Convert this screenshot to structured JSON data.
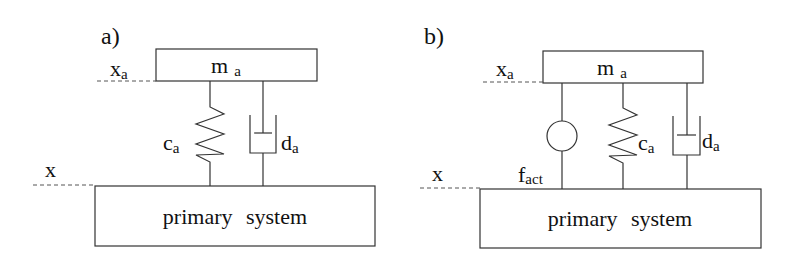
{
  "panels": [
    {
      "id": "a",
      "label": "a)",
      "mass": {
        "symbol": "m",
        "subscript": "a"
      },
      "absorber_coordinate": {
        "symbol": "x",
        "subscript": "a"
      },
      "primary_coordinate": {
        "symbol": "x"
      },
      "spring": {
        "symbol": "c",
        "subscript": "a"
      },
      "damper": {
        "symbol": "d",
        "subscript": "a"
      },
      "primary_system": {
        "label": "primary system"
      }
    },
    {
      "id": "b",
      "label": "b)",
      "mass": {
        "symbol": "m",
        "subscript": "a"
      },
      "absorber_coordinate": {
        "symbol": "x",
        "subscript": "a"
      },
      "primary_coordinate": {
        "symbol": "x"
      },
      "actuator": {
        "symbol": "f",
        "subscript": "act"
      },
      "spring": {
        "symbol": "c",
        "subscript": "a"
      },
      "damper": {
        "symbol": "d",
        "subscript": "a"
      },
      "primary_system": {
        "label": "primary system"
      }
    }
  ]
}
